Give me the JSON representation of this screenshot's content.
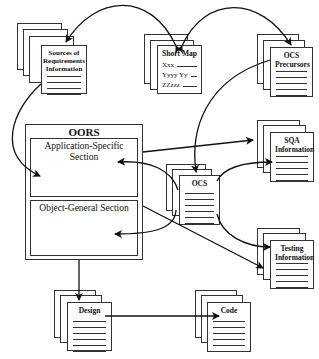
{
  "diagram": {
    "documents": {
      "sources": {
        "title": "Sources of Requirements Information"
      },
      "short_map": {
        "title": "Short Map",
        "rows": [
          "Xxx",
          "Yyyy Yy",
          "ZZzzz"
        ]
      },
      "ocs_precursors": {
        "title": "OCS Precursors"
      },
      "sqa": {
        "title": "SQA Information"
      },
      "ocs": {
        "title": "OCS"
      },
      "testing": {
        "title": "Testing Information"
      },
      "design": {
        "title": "Design"
      },
      "code": {
        "title": "Code"
      }
    },
    "oors": {
      "title": "OORS",
      "sections": [
        {
          "label": "Application-Specific Section"
        },
        {
          "label": "Object-General Section"
        }
      ]
    },
    "colors": {
      "stroke": "#111111",
      "paper": "#ffffff"
    }
  }
}
